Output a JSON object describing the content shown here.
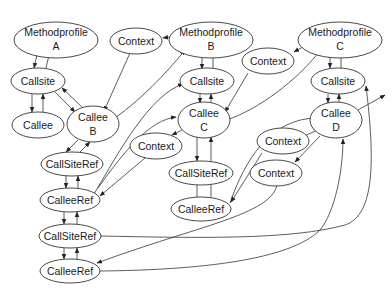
{
  "diagram": {
    "type": "directed-graph",
    "nodes": {
      "mp_a": {
        "label1": "Methodprofile",
        "label2": "A"
      },
      "ctx_top": {
        "label": "Context"
      },
      "mp_b": {
        "label1": "Methodprofile",
        "label2": "B"
      },
      "mp_c": {
        "label1": "Methodprofile",
        "label2": "C"
      },
      "ctx_c": {
        "label": "Context"
      },
      "cs_a": {
        "label": "Callsite"
      },
      "cs_b": {
        "label": "Callsite"
      },
      "cs_c": {
        "label": "Callsite"
      },
      "callee_a": {
        "label": "Callee"
      },
      "callee_b": {
        "label1": "Callee",
        "label2": "B"
      },
      "callee_c": {
        "label1": "Callee",
        "label2": "C"
      },
      "callee_d": {
        "label1": "Callee",
        "label2": "D"
      },
      "ctx_mid": {
        "label": "Context"
      },
      "ctx_d1": {
        "label": "Context"
      },
      "ctx_d2": {
        "label": "Context"
      },
      "csr_b": {
        "label": "CallSiteRef"
      },
      "csr_c": {
        "label": "CallSiteRef"
      },
      "cr_b": {
        "label": "CalleeRef"
      },
      "cr_c": {
        "label": "CalleeRef"
      },
      "csr_2": {
        "label": "CallSiteRef"
      },
      "cr_2": {
        "label": "CalleeRef"
      }
    },
    "edges": [
      [
        "mp_a",
        "cs_a"
      ],
      [
        "cs_a",
        "mp_a"
      ],
      [
        "cs_a",
        "callee_a"
      ],
      [
        "callee_a",
        "cs_a"
      ],
      [
        "cs_a",
        "callee_b"
      ],
      [
        "callee_b",
        "cs_a"
      ],
      [
        "ctx_top",
        "callee_b"
      ],
      [
        "mp_b",
        "ctx_top"
      ],
      [
        "callee_b",
        "mp_b"
      ],
      [
        "mp_b",
        "cs_b"
      ],
      [
        "cs_b",
        "mp_b"
      ],
      [
        "cs_b",
        "callee_c"
      ],
      [
        "callee_c",
        "cs_b"
      ],
      [
        "mp_c",
        "ctx_c"
      ],
      [
        "ctx_c",
        "callee_c"
      ],
      [
        "callee_c",
        "mp_c"
      ],
      [
        "mp_c",
        "cs_c"
      ],
      [
        "cs_c",
        "mp_c"
      ],
      [
        "cs_c",
        "callee_d"
      ],
      [
        "callee_d",
        "cs_c"
      ],
      [
        "callee_b",
        "csr_b"
      ],
      [
        "csr_b",
        "callee_b"
      ],
      [
        "csr_b",
        "cr_b"
      ],
      [
        "cr_b",
        "csr_b"
      ],
      [
        "cr_b",
        "cs_b"
      ],
      [
        "callee_c",
        "ctx_mid"
      ],
      [
        "ctx_mid",
        "cr_b"
      ],
      [
        "callee_c",
        "csr_c"
      ],
      [
        "csr_c",
        "callee_c"
      ],
      [
        "csr_c",
        "cr_c"
      ],
      [
        "cr_c",
        "csr_c"
      ],
      [
        "cr_c",
        "callee_d"
      ],
      [
        "callee_d",
        "ctx_d1"
      ],
      [
        "ctx_d1",
        "cr_c"
      ],
      [
        "callee_d",
        "ctx_d2"
      ],
      [
        "ctx_d2",
        "cr_2"
      ],
      [
        "cr_b",
        "csr_2"
      ],
      [
        "csr_2",
        "cr_b"
      ],
      [
        "csr_2",
        "cr_2"
      ],
      [
        "cr_2",
        "csr_2"
      ],
      [
        "csr_2",
        "cs_c"
      ],
      [
        "cr_2",
        "callee_d"
      ],
      [
        "callee_d",
        "out"
      ]
    ]
  }
}
